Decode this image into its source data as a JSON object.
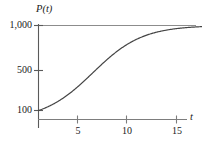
{
  "chart_data": {
    "type": "line",
    "title": "",
    "subtitle": "",
    "xlabel": "t",
    "ylabel": "P(t)",
    "grid": false,
    "legend_position": "none",
    "xlim": [
      0,
      16.5
    ],
    "ylim": [
      0,
      1080
    ],
    "xticks": [
      5,
      10,
      15
    ],
    "xtick_labels": [
      "5",
      "10",
      "15"
    ],
    "yticks": [
      100,
      500,
      1000
    ],
    "ytick_labels": [
      "100",
      "500",
      "1,000"
    ],
    "annotations": [
      {
        "text": "asymptote at P = 1,000",
        "value": 1000,
        "kind": "horizontal-line"
      }
    ],
    "series": [
      {
        "name": "P(t)",
        "description": "logistic growth curve from 100 toward carrying capacity 1,000",
        "carrying_capacity": 1000,
        "initial_value": 100,
        "inflection_t": 6,
        "growth_rate": 0.4,
        "color": "#444444",
        "x": [
          0,
          1,
          2,
          3,
          4,
          5,
          6,
          7,
          8,
          9,
          10,
          11,
          12,
          13,
          14,
          15,
          16,
          16.5
        ],
        "y": [
          100,
          141,
          195,
          265,
          351,
          450,
          555,
          656,
          744,
          815,
          869,
          909,
          937,
          957,
          971,
          980,
          987,
          989
        ]
      },
      {
        "name": "asymptote",
        "description": "horizontal reference line at carrying capacity",
        "color": "#808080",
        "x": [
          0,
          16.5
        ],
        "y": [
          1000,
          1000
        ]
      }
    ]
  },
  "axes": {
    "y_axis_name": "P(t)",
    "x_axis_name": "t",
    "axis_color": "#666666",
    "curve_color": "#444444",
    "asymptote_color": "#8c8c8c",
    "label_color": "#1a1a1a"
  },
  "ticks": {
    "y": [
      {
        "label": "1,000",
        "value": 1000
      },
      {
        "label": "500",
        "value": 500
      },
      {
        "label": "100",
        "value": 100
      }
    ],
    "x": [
      {
        "label": "5",
        "value": 5
      },
      {
        "label": "10",
        "value": 10
      },
      {
        "label": "15",
        "value": 15
      }
    ]
  }
}
